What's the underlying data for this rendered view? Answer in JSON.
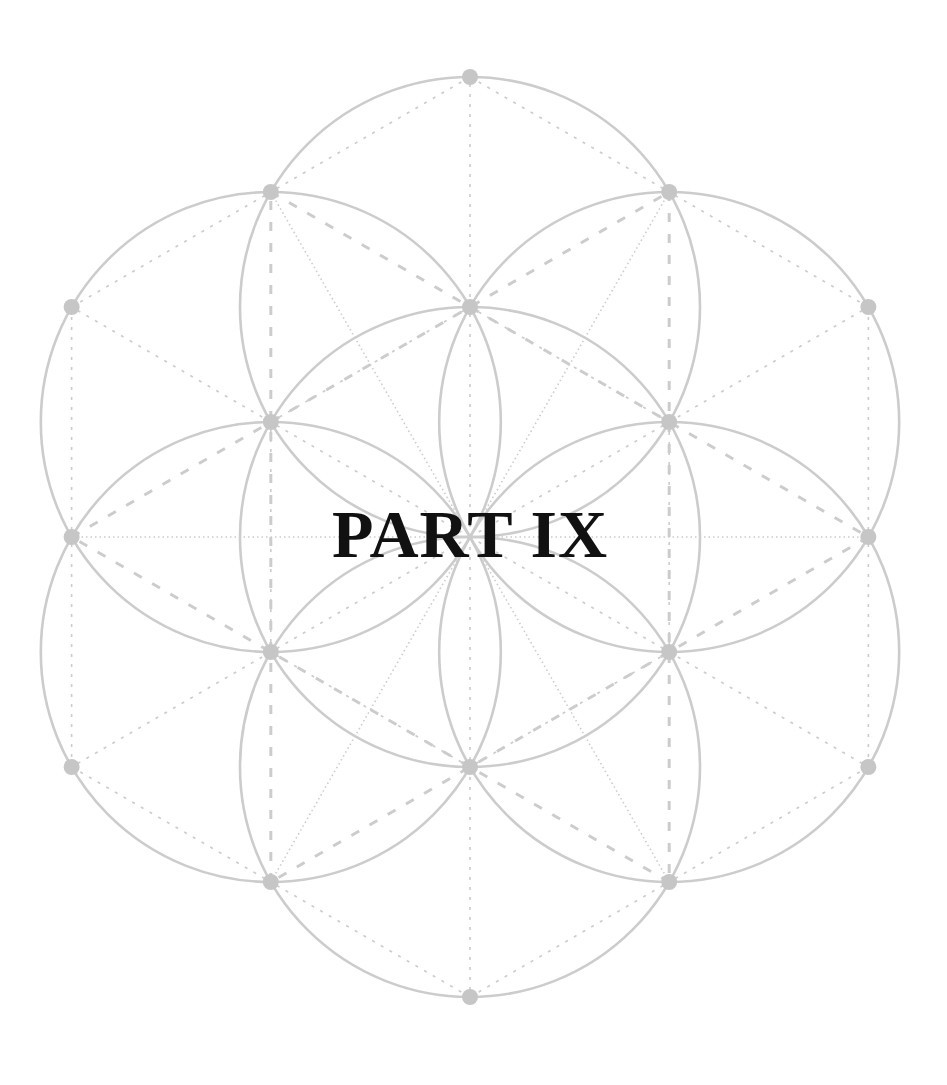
{
  "page": {
    "title": "PART IX",
    "background": "#ffffff",
    "text_color": "#111111"
  },
  "figure": {
    "name": "seed-of-life-geometry",
    "center": [
      470,
      537
    ],
    "radius": 230,
    "stroke_color": "#cccccc",
    "dot_color": "#c6c6c6",
    "dot_radius": 8,
    "circle_count": 7,
    "dot_count": 19
  }
}
